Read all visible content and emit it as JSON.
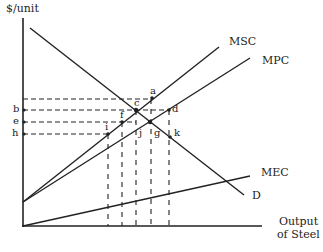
{
  "axes": {
    "y_label": "$/unit",
    "x_label_line1": "Output",
    "x_label_line2": "of Steel"
  },
  "curves": {
    "msc": "MSC",
    "mpc": "MPC",
    "mec": "MEC",
    "demand": "D"
  },
  "price_labels": {
    "b": "b",
    "e": "e",
    "h": "h"
  },
  "points": {
    "a": "a",
    "c": "c",
    "d": "d",
    "f": "f",
    "i": "i",
    "j": "j",
    "g": "g",
    "k": "k"
  },
  "colors": {
    "line": "#222222",
    "background": "#ffffff"
  }
}
